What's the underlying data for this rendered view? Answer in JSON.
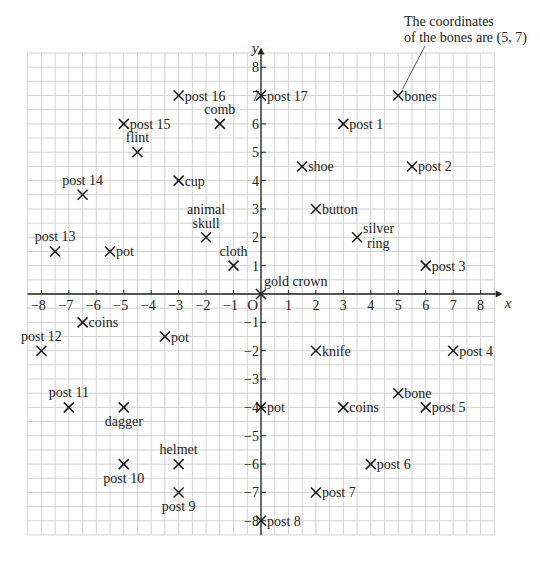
{
  "annotation": {
    "line1": "The coordinates",
    "line2": "of the bones are (5, 7)",
    "target": [
      5,
      7
    ]
  },
  "chart_data": {
    "type": "scatter",
    "title": "",
    "xlabel": "x",
    "ylabel": "y",
    "origin_label": "O",
    "xlim": [
      -8,
      8
    ],
    "ylim": [
      -8,
      8
    ],
    "grid": true,
    "grid_step": 0.5,
    "x_ticks": [
      -8,
      -7,
      -6,
      -5,
      -4,
      -3,
      -2,
      -1,
      1,
      2,
      3,
      4,
      5,
      6,
      7,
      8
    ],
    "y_ticks": [
      -8,
      -7,
      -6,
      -5,
      -4,
      -3,
      -2,
      -1,
      1,
      2,
      3,
      4,
      5,
      6,
      7,
      8
    ],
    "points": [
      {
        "label": "bones",
        "x": 5,
        "y": 7,
        "pos": "right"
      },
      {
        "label": "post 1",
        "x": 3,
        "y": 6,
        "pos": "right"
      },
      {
        "label": "post 2",
        "x": 5.5,
        "y": 4.5,
        "pos": "right"
      },
      {
        "label": "post 3",
        "x": 6,
        "y": 1,
        "pos": "right"
      },
      {
        "label": "post 4",
        "x": 7,
        "y": -2,
        "pos": "right"
      },
      {
        "label": "post 5",
        "x": 6,
        "y": -4,
        "pos": "right"
      },
      {
        "label": "post 6",
        "x": 4,
        "y": -6,
        "pos": "right"
      },
      {
        "label": "post 7",
        "x": 2,
        "y": -7,
        "pos": "right"
      },
      {
        "label": "post 8",
        "x": 0,
        "y": -8,
        "pos": "right"
      },
      {
        "label": "post 9",
        "x": -3,
        "y": -7,
        "pos": "below"
      },
      {
        "label": "post 10",
        "x": -5,
        "y": -6,
        "pos": "below"
      },
      {
        "label": "post 11",
        "x": -7,
        "y": -4,
        "pos": "above"
      },
      {
        "label": "post 12",
        "x": -8,
        "y": -2,
        "pos": "above"
      },
      {
        "label": "post 13",
        "x": -7.5,
        "y": 1.5,
        "pos": "above"
      },
      {
        "label": "post 14",
        "x": -6.5,
        "y": 3.5,
        "pos": "above"
      },
      {
        "label": "post 15",
        "x": -5,
        "y": 6,
        "pos": "right"
      },
      {
        "label": "post 16",
        "x": -3,
        "y": 7,
        "pos": "right"
      },
      {
        "label": "post 17",
        "x": 0,
        "y": 7,
        "pos": "right"
      },
      {
        "label": "comb",
        "x": -1.5,
        "y": 6,
        "pos": "above"
      },
      {
        "label": "flint",
        "x": -4.5,
        "y": 5,
        "pos": "above"
      },
      {
        "label": "cup",
        "x": -3,
        "y": 4,
        "pos": "right"
      },
      {
        "label": "shoe",
        "x": 1.5,
        "y": 4.5,
        "pos": "right"
      },
      {
        "label": "button",
        "x": 2,
        "y": 3,
        "pos": "right"
      },
      {
        "label": "silver ring",
        "lines": [
          "silver",
          "ring"
        ],
        "x": 3.5,
        "y": 2,
        "pos": "right2"
      },
      {
        "label": "animal skull",
        "lines": [
          "animal",
          "skull"
        ],
        "x": -2,
        "y": 2,
        "pos": "above2"
      },
      {
        "label": "pot",
        "x": -5.5,
        "y": 1.5,
        "pos": "right"
      },
      {
        "label": "cloth",
        "x": -1,
        "y": 1,
        "pos": "above"
      },
      {
        "label": "gold crown",
        "x": 0,
        "y": 0,
        "pos": "aboveright"
      },
      {
        "label": "coins",
        "x": -6.5,
        "y": -1,
        "pos": "right"
      },
      {
        "label": "pot",
        "x": -3.5,
        "y": -1.5,
        "pos": "right"
      },
      {
        "label": "knife",
        "x": 2,
        "y": -2,
        "pos": "right"
      },
      {
        "label": "dagger",
        "x": -5,
        "y": -4,
        "pos": "below"
      },
      {
        "label": "pot",
        "x": 0,
        "y": -4,
        "pos": "right"
      },
      {
        "label": "coins",
        "x": 3,
        "y": -4,
        "pos": "right"
      },
      {
        "label": "bone",
        "x": 5,
        "y": -3.5,
        "pos": "right"
      },
      {
        "label": "helmet",
        "x": -3,
        "y": -6,
        "pos": "above"
      }
    ]
  },
  "colors": {
    "grid": "#c8c8c8",
    "axis": "#222222",
    "marker": "#1a1a1a",
    "text": "#222222"
  }
}
